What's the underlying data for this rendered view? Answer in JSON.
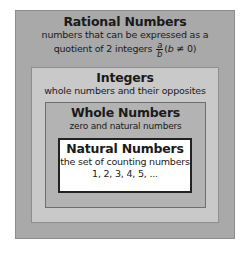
{
  "diagram": {
    "type": "nested-sets",
    "sets": [
      {
        "title": "Rational Numbers",
        "description_line1": "numbers that can be expressed as a",
        "description_line2_prefix": "quotient of 2 integers",
        "fraction": {
          "numerator": "a",
          "denominator": "b"
        },
        "condition_open": "(",
        "condition_var": "b",
        "condition_rest": " ≠ 0)"
      },
      {
        "title": "Integers",
        "description": "whole numbers and their opposites"
      },
      {
        "title": "Whole Numbers",
        "description": "zero and natural numbers"
      },
      {
        "title": "Natural Numbers",
        "description": "the set of counting numbers",
        "examples": "1, 2, 3, 4, 5, ..."
      }
    ],
    "colors": {
      "rational_bg": "#a9a9a9",
      "integers_bg": "#c9c9c9",
      "whole_bg": "#b3b3b3",
      "natural_bg": "#ffffff"
    }
  }
}
